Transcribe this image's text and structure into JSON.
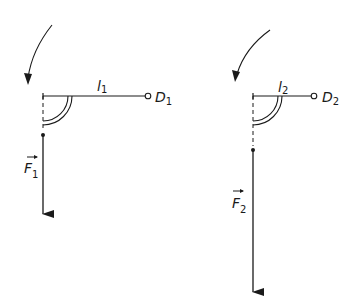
{
  "diagram": {
    "colors": {
      "stroke": "#1a1a1a",
      "background": "#ffffff"
    },
    "left": {
      "lever_label": "l",
      "lever_sub": "1",
      "pivot_label": "D",
      "pivot_sub": "1",
      "force_label": "F",
      "force_sub": "1",
      "rotation": "counterclockwise-arrow"
    },
    "right": {
      "lever_label": "l",
      "lever_sub": "2",
      "pivot_label": "D",
      "pivot_sub": "2",
      "force_label": "F",
      "force_sub": "2",
      "rotation": "counterclockwise-arrow"
    }
  }
}
